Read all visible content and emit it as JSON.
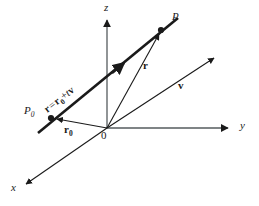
{
  "figure": {
    "background_color": "#ffffff",
    "stroke_color": "#1a1a1a",
    "axes": [
      {
        "name": "x-axis",
        "label": "x",
        "label_x": 12,
        "label_y": 186,
        "from": [
          107,
          128
        ],
        "to": [
          26,
          184
        ]
      },
      {
        "name": "y-axis",
        "label": "y",
        "label_x": 241,
        "label_y": 122,
        "from": [
          107,
          128
        ],
        "to": [
          228,
          128
        ]
      },
      {
        "name": "z-axis",
        "label": "z",
        "label_x": 104,
        "label_y": 4,
        "from": [
          107,
          128
        ],
        "to": [
          107,
          20
        ]
      }
    ],
    "origin": {
      "label": "0",
      "label_x": 101,
      "label_y": 131,
      "x": 107,
      "y": 128
    },
    "points": [
      {
        "name": "point-P0",
        "label": "P",
        "sub": "0",
        "label_x": 25,
        "label_y": 108,
        "x": 51,
        "y": 118
      },
      {
        "name": "point-P",
        "label": "P",
        "sub": "",
        "label_x": 172,
        "label_y": 13,
        "x": 161,
        "y": 30
      }
    ],
    "vectors": [
      {
        "name": "vector-r0",
        "label": "r",
        "sub": "0",
        "label_x": 66,
        "label_y": 127,
        "from": [
          107,
          128
        ],
        "to": [
          55,
          119
        ]
      },
      {
        "name": "vector-r",
        "label": "r",
        "sub": "",
        "label_x": 144,
        "label_y": 63,
        "from": [
          107,
          128
        ],
        "to": [
          160,
          33
        ]
      },
      {
        "name": "vector-v",
        "label": "v",
        "sub": "",
        "label_x": 178,
        "label_y": 83,
        "from": [
          107,
          128
        ],
        "to": [
          215,
          57
        ]
      }
    ],
    "line": {
      "name": "line-through-P0-and-P",
      "equation_plain": "r = r0 + tv",
      "equation_parts": {
        "lhs": "r",
        "eq": "=",
        "rhs_a": "r",
        "rhs_a_sub": "0",
        "plus": "+",
        "t": "t",
        "v": "v"
      },
      "label_x": 53,
      "label_y": 100,
      "label_rotation_deg": -38,
      "from": [
        38,
        133
      ],
      "to": [
        178,
        18
      ]
    }
  }
}
